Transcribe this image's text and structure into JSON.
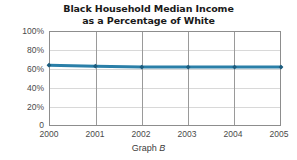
{
  "chart_data": {
    "type": "line",
    "title": "Black Household Median Income as a Percentage of White",
    "title_lines": [
      "Black Household Median Income",
      "as a Percentage of White"
    ],
    "caption_prefix": "Graph",
    "caption_label": "B",
    "xlabel": "",
    "ylabel": "",
    "categories": [
      "2000",
      "2001",
      "2002",
      "2003",
      "2004",
      "2005"
    ],
    "x": [
      2000,
      2001,
      2002,
      2003,
      2004,
      2005
    ],
    "values": [
      64,
      63,
      62,
      62,
      62,
      62
    ],
    "series": [
      {
        "name": "Black household median income as a percentage of white",
        "values": [
          64,
          63,
          62,
          62,
          62,
          62
        ]
      }
    ],
    "ylim": [
      0,
      100
    ],
    "xlim": [
      2000,
      2005
    ],
    "y_ticks": [
      0,
      20,
      40,
      60,
      80,
      100
    ],
    "y_tick_labels": [
      "0",
      "20%",
      "40%",
      "60%",
      "80%",
      "100%"
    ],
    "x_ticks": [
      2000,
      2001,
      2002,
      2003,
      2004,
      2005
    ],
    "x_tick_labels": [
      "2000",
      "2001",
      "2002",
      "2003",
      "2004",
      "2005"
    ],
    "grid": {
      "horizontal": true,
      "vertical": true
    },
    "legend": {
      "visible": false,
      "position": "none"
    },
    "colors": {
      "line": "#2a7fa8",
      "marker": "#1b5b7d",
      "frame": "#8d8d8d",
      "h_gridline": "#d8d8d8",
      "v_gridline": "#9a9a9a",
      "title_text": "#1a1a1a",
      "tick_text": "#4a4a4a",
      "caption_text": "#3d3d3d",
      "background": "#ffffff"
    },
    "marker_style": "diamond",
    "line_width_px": 3
  }
}
